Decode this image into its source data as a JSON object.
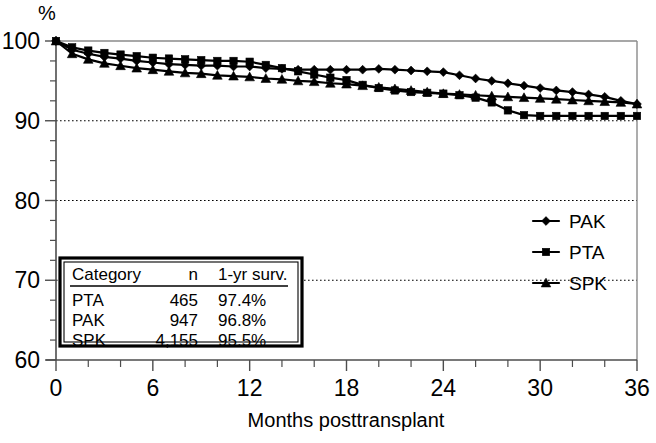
{
  "chart_data": {
    "type": "line",
    "title": "",
    "xlabel": "Months posttransplant",
    "ylabel": "%",
    "xlim": [
      0,
      36
    ],
    "ylim": [
      60,
      100
    ],
    "xticks": [
      0,
      6,
      12,
      18,
      24,
      30,
      36
    ],
    "xtick_labels": [
      "0",
      "6",
      "12",
      "18",
      "24",
      "30",
      "36"
    ],
    "yticks": [
      60,
      70,
      80,
      90,
      100
    ],
    "ytick_labels": [
      "60",
      "70",
      "80",
      "90",
      "100"
    ],
    "x_minor_tick_step": 2,
    "y_minor_tick_step": 2.5,
    "gridlines": {
      "y": [
        70,
        80,
        90
      ],
      "style": "dotted"
    },
    "legend_position": "right-middle",
    "x": [
      0,
      1,
      2,
      3,
      4,
      5,
      6,
      7,
      8,
      9,
      10,
      11,
      12,
      13,
      14,
      15,
      16,
      17,
      18,
      19,
      20,
      21,
      22,
      23,
      24,
      25,
      26,
      27,
      28,
      29,
      30,
      31,
      32,
      33,
      34,
      35,
      36
    ],
    "series": [
      {
        "name": "PAK",
        "marker": "diamond",
        "values": [
          100.0,
          98.9,
          98.4,
          98.0,
          97.8,
          97.5,
          97.3,
          97.1,
          97.0,
          96.9,
          96.9,
          96.8,
          96.8,
          96.6,
          96.5,
          96.4,
          96.4,
          96.4,
          96.4,
          96.4,
          96.5,
          96.4,
          96.3,
          96.2,
          96.1,
          95.7,
          95.3,
          95.0,
          94.7,
          94.4,
          94.1,
          93.8,
          93.6,
          93.3,
          93.0,
          92.5,
          92.1
        ]
      },
      {
        "name": "PTA",
        "marker": "square",
        "values": [
          100.0,
          99.2,
          98.8,
          98.5,
          98.3,
          98.1,
          97.9,
          97.8,
          97.7,
          97.6,
          97.5,
          97.5,
          97.4,
          97.0,
          96.6,
          96.2,
          95.8,
          95.4,
          95.1,
          94.5,
          94.1,
          93.8,
          93.6,
          93.5,
          93.4,
          93.2,
          92.9,
          92.3,
          91.3,
          90.7,
          90.6,
          90.6,
          90.6,
          90.6,
          90.6,
          90.6,
          90.6
        ]
      },
      {
        "name": "SPK",
        "marker": "triangle",
        "values": [
          100.0,
          98.4,
          97.7,
          97.2,
          96.9,
          96.6,
          96.4,
          96.2,
          96.0,
          95.9,
          95.7,
          95.6,
          95.5,
          95.3,
          95.2,
          95.0,
          94.9,
          94.7,
          94.6,
          94.4,
          94.2,
          94.0,
          93.8,
          93.6,
          93.4,
          93.3,
          93.2,
          93.1,
          93.0,
          92.9,
          92.8,
          92.7,
          92.6,
          92.5,
          92.4,
          92.3,
          92.1
        ]
      }
    ]
  },
  "legend": {
    "items": [
      {
        "label": "PAK",
        "marker": "diamond"
      },
      {
        "label": "PTA",
        "marker": "square"
      },
      {
        "label": "SPK",
        "marker": "triangle"
      }
    ]
  },
  "stats_table": {
    "headers": [
      "Category",
      "n",
      "1-yr surv."
    ],
    "rows": [
      {
        "category": "PTA",
        "n": "465",
        "survival": "97.4%"
      },
      {
        "category": "PAK",
        "n": "947",
        "survival": "96.8%"
      },
      {
        "category": "SPK",
        "n": "4,155",
        "survival": "95.5%"
      }
    ]
  },
  "colors": {
    "ink": "#000000",
    "axis": "#4d4d4d",
    "frame": "#8a8a8a",
    "background": "#ffffff"
  }
}
